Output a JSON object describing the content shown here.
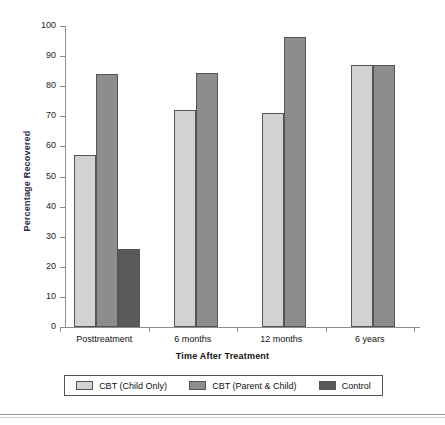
{
  "chart_data": {
    "type": "bar",
    "title": "",
    "xlabel": "Time After Treatment",
    "ylabel": "Percentage Recovered",
    "categories": [
      "Posttreatment",
      "6 months",
      "12 months",
      "6 years"
    ],
    "ylim": [
      0,
      100
    ],
    "yticks": [
      0,
      10,
      20,
      30,
      40,
      50,
      60,
      70,
      80,
      90,
      100
    ],
    "ytick_labels": [
      "0",
      "10",
      "20",
      "30",
      "40",
      "50",
      "60",
      "70",
      "80",
      "90",
      "100"
    ],
    "grid": false,
    "legend_position": "bottom",
    "series": [
      {
        "name": "CBT (Child Only)",
        "color": "#d2d2d2",
        "values": [
          57,
          72,
          71,
          87
        ]
      },
      {
        "name": "CBT (Parent & Child)",
        "color": "#8d8d8d",
        "values": [
          84,
          84.5,
          96.5,
          87
        ]
      },
      {
        "name": "Control",
        "color": "#5a5a5a",
        "values": [
          26,
          null,
          null,
          null
        ]
      }
    ]
  },
  "axes": {
    "y_title": "Percentage Recovered",
    "x_title": "Time After Treatment"
  },
  "legend": {
    "entries": [
      {
        "label": "CBT (Child Only)",
        "color": "#d2d2d2"
      },
      {
        "label": "CBT (Parent & Child)",
        "color": "#8d8d8d"
      },
      {
        "label": "Control",
        "color": "#5a5a5a"
      }
    ]
  }
}
